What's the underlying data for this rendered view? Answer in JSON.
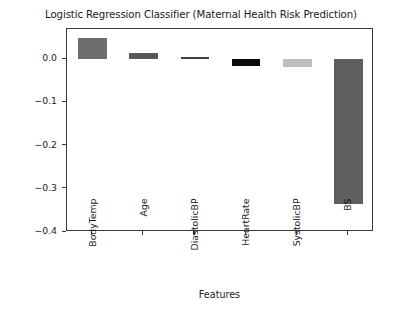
{
  "chart_data": {
    "type": "bar",
    "title": "Logistic Regression Classifier (Maternal Health Risk Prediction)",
    "xlabel": "Features",
    "ylabel": "Features Importance Score",
    "categories": [
      "BodyTemp",
      "Age",
      "DiastolicBP",
      "HeartRate",
      "SystolicBP",
      "BS"
    ],
    "values": [
      0.05,
      0.015,
      0.006,
      -0.015,
      -0.017,
      -0.336
    ],
    "ylim": [
      -0.4,
      0.07
    ],
    "yticks": [
      0.0,
      -0.1,
      -0.2,
      -0.3,
      -0.4
    ],
    "ytick_labels": [
      "0.0",
      "-0.1",
      "-0.2",
      "-0.3",
      "-0.4"
    ],
    "grid": false,
    "legend": "none",
    "bar_colors": [
      "#6e6e6e",
      "#5a5a5a",
      "#3f3f3f",
      "#0b0b0b",
      "#bfbfbf",
      "#5f5f5f"
    ]
  }
}
